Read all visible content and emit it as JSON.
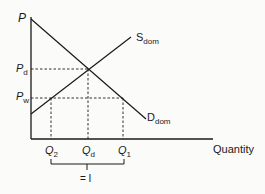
{
  "diagram": {
    "type": "supply-demand",
    "y_axis_label": "P",
    "x_axis_label": "Quantity",
    "price_labels": {
      "pd": {
        "base": "P",
        "sub": "d"
      },
      "pw": {
        "base": "P",
        "sub": "w"
      }
    },
    "quantity_labels": {
      "q2": {
        "base": "Q",
        "sub": "2"
      },
      "qd": {
        "base": "Q",
        "sub": "d"
      },
      "q1": {
        "base": "Q",
        "sub": "1"
      }
    },
    "curves": {
      "supply": {
        "base": "S",
        "sub": "dom"
      },
      "demand": {
        "base": "D",
        "sub": "dom"
      }
    },
    "brace_label": "= I"
  }
}
